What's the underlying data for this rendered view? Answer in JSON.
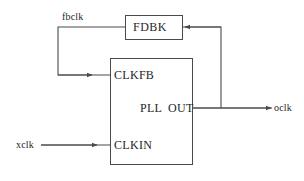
{
  "diagram": {
    "colors": {
      "background": "#ffffff",
      "line": "#4a4a4a",
      "box_stroke": "#4a4a4a",
      "text": "#262626"
    },
    "blocks": [
      {
        "id": "fdbk",
        "label": "FDBK",
        "x": 125,
        "y": 15,
        "w": 57,
        "h": 24
      },
      {
        "id": "pll",
        "label": "PLL",
        "x": 110,
        "y": 58,
        "w": 82,
        "h": 106
      }
    ],
    "ports": {
      "clkfb": "CLKFB",
      "clkin": "CLKIN",
      "out": "OUT"
    },
    "signals": {
      "fbclk": "fbclk",
      "xclk": "xclk",
      "oclk": "oclk"
    }
  }
}
